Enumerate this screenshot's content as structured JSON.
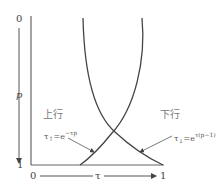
{
  "diagram": {
    "y_axis": {
      "label": "p",
      "top_tick": "0",
      "bottom_tick": "1",
      "direction": "down"
    },
    "x_axis": {
      "label": "τ",
      "left_tick": "0",
      "right_tick": "1",
      "direction": "right"
    },
    "curves": [
      {
        "name": "上行",
        "equation_base": "τ",
        "equation_sub": "↑",
        "equation_rest": "=e",
        "equation_sup": "−τp"
      },
      {
        "name": "下行",
        "equation_base": "τ",
        "equation_sub": "↓",
        "equation_rest": "=e",
        "equation_sup": "τ(p−1)"
      }
    ],
    "colors": {
      "line": "#444444",
      "text": "#555555"
    }
  }
}
